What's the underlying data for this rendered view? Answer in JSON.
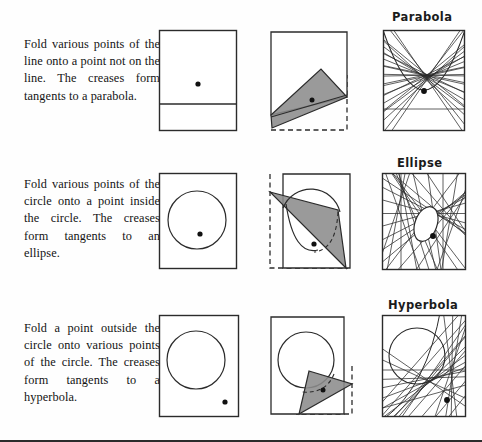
{
  "page": {
    "background_color": "#fefefe",
    "ink_color": "#1a1a1a",
    "fold_fill_color": "#8c8c8c",
    "width": 482,
    "height": 442
  },
  "rows": [
    {
      "id": "parabola-row",
      "caption": "Fold various points of the line onto a point not on the line. The creases form tangents to a parabola.",
      "conic_label": "Parabola",
      "panels": [
        {
          "name": "setup-panel",
          "kind": "setup",
          "contents": [
            "rectangle-sheet",
            "horizontal-line",
            "focus-dot"
          ]
        },
        {
          "name": "fold-panel",
          "kind": "fold",
          "contents": [
            "rectangle-sheet",
            "dashed-original-outline",
            "gray-folded-flap",
            "crease-line",
            "focus-dot"
          ]
        },
        {
          "name": "envelope-panel",
          "kind": "envelope",
          "contents": [
            "rectangle-sheet",
            "crease-lines",
            "parabola-envelope",
            "focus-dot"
          ]
        }
      ]
    },
    {
      "id": "ellipse-row",
      "caption": "Fold various points of the circle onto a point inside the circle. The creases form tangents to an ellipse.",
      "conic_label": "Ellipse",
      "panels": [
        {
          "name": "setup-panel",
          "kind": "setup",
          "contents": [
            "rectangle-sheet",
            "circle",
            "interior-focus-dot"
          ]
        },
        {
          "name": "fold-panel",
          "kind": "fold",
          "contents": [
            "rectangle-sheet",
            "dashed-original-outline",
            "gray-folded-flap",
            "circle-arc",
            "dashed-folded-arc",
            "interior-focus-dot"
          ]
        },
        {
          "name": "envelope-panel",
          "kind": "envelope",
          "contents": [
            "rectangle-sheet",
            "crease-lines",
            "ellipse-envelope",
            "interior-focus-dot"
          ]
        }
      ]
    },
    {
      "id": "hyperbola-row",
      "caption": "Fold a point outside the circle onto various points of the circle. The creases form tangents to a hyperbola.",
      "conic_label": "Hyperbola",
      "panels": [
        {
          "name": "setup-panel",
          "kind": "setup",
          "contents": [
            "rectangle-sheet",
            "circle",
            "exterior-focus-dot"
          ]
        },
        {
          "name": "fold-panel",
          "kind": "fold",
          "contents": [
            "rectangle-sheet",
            "dashed-original-outline",
            "circle",
            "gray-folded-flap",
            "dashed-folded-arc",
            "exterior-focus-dot"
          ]
        },
        {
          "name": "envelope-panel",
          "kind": "envelope",
          "contents": [
            "rectangle-sheet",
            "circle",
            "crease-lines",
            "hyperbola-envelope",
            "exterior-focus-dot"
          ]
        }
      ]
    }
  ]
}
